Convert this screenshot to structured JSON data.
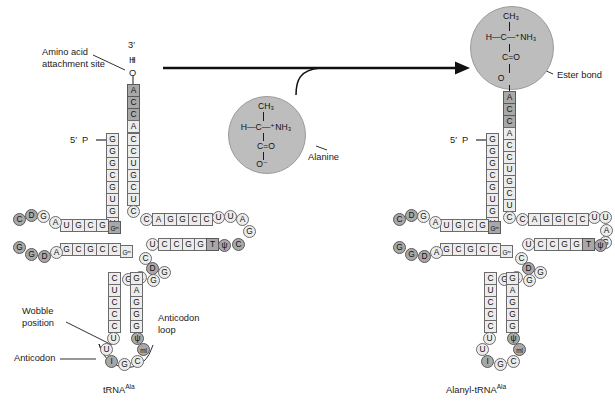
{
  "figure": {
    "arrow": "reaction-arrow"
  },
  "labels": {
    "amino_acid_attachment_site": "Amino acid\nattachment site",
    "three_prime": "3′",
    "five_prime_left": "5′  P",
    "five_prime_right": "5′  P",
    "h_atom": "H",
    "o_atom": "O",
    "alanine": "Alanine",
    "ester_bond": "Ester bond",
    "wobble_position": "Wobble\nposition",
    "anticodon": "Anticodon",
    "anticodon_loop": "Anticodon\nloop",
    "trna_left_name": "tRNA",
    "trna_left_sup": "Ala",
    "trna_right_name": "Alanyl-tRNA",
    "trna_right_sup": "Ala"
  },
  "alanine_free": {
    "methyl": "CH₃",
    "alpha": "H—C—⁺NH₃",
    "carbonyl": "C=O",
    "carboxylate": "O⁻"
  },
  "alanine_bound": {
    "methyl": "CH₃",
    "alpha": "H—C—⁺NH₃",
    "carbonyl": "C=O",
    "ester_oxygen": "O"
  },
  "colors": {
    "normal_base_fill": "#ececec",
    "modified_base_fill": "#a8a8a8",
    "amino_acid_circle": "#bdbdbd",
    "outline": "#6b6b6b",
    "text": "#1a1a1a"
  },
  "trna_structure": {
    "name": "tRNA-Ala (yeast)",
    "acceptor_stem_3prime": [
      "A",
      "C",
      "C",
      "A",
      "C",
      "C",
      "U",
      "G",
      "C",
      "U",
      "C"
    ],
    "acceptor_stem_3prime_modified": [
      true,
      true,
      true,
      false,
      false,
      false,
      false,
      false,
      false,
      false,
      false
    ],
    "acceptor_stem_5prime": [
      "G",
      "G",
      "G",
      "C",
      "G",
      "U",
      "G",
      "U"
    ],
    "d_arm_top": [
      "U",
      "G",
      "C",
      "G",
      "G"
    ],
    "d_arm_top_end": "Gᵐ",
    "d_arm_bottom": [
      "G",
      "C",
      "G",
      "C",
      "C"
    ],
    "d_arm_bottom_end": "Gᵐ",
    "d_loop_top": [
      "C",
      "D",
      "G",
      "A"
    ],
    "d_loop_bottom": [
      "G",
      "G",
      "D",
      "A"
    ],
    "t_arm_top": [
      "C",
      "A",
      "G",
      "G",
      "C",
      "C"
    ],
    "t_loop_top": [
      "U",
      "U",
      "A",
      "G"
    ],
    "t_arm_bottom": [
      "U",
      "C",
      "C",
      "G",
      "G"
    ],
    "t_loop_bottom": [
      "T",
      "ψ",
      "C"
    ],
    "variable_loop": [
      "C",
      "D",
      "G",
      "G",
      "A",
      "G"
    ],
    "anticodon_stem_left": [
      "C",
      "U",
      "C",
      "C",
      "C",
      "U",
      "U"
    ],
    "anticodon_stem_right": [
      "G",
      "A",
      "G",
      "G",
      "G",
      "ψ",
      "mI"
    ],
    "anticodon": [
      "I",
      "G",
      "C"
    ],
    "wobble_base": "I"
  }
}
